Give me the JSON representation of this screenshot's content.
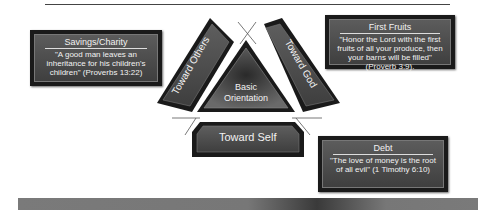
{
  "diagram": {
    "center": {
      "line1": "Basic",
      "line2": "Orientation"
    },
    "segments": {
      "left": "Toward Others",
      "right": "Toward God",
      "bottom": "Toward Self"
    },
    "boxes": {
      "savings": {
        "title": "Savings/Charity",
        "text": "\"A good man leaves an inheritance for his children's children\" (Proverbs 13:22)"
      },
      "first_fruits": {
        "title": "First Fruits",
        "text": "\"Honor the Lord with the first fruits of all your produce, then your barns will be filled\" (Proverb 3:9)."
      },
      "debt": {
        "title": "Debt",
        "text": "\"The love of money is the root of all evil\" (1 Timothy 6:10)"
      }
    },
    "colors": {
      "panel": "#4a4a4a",
      "border": "#1a1a1a",
      "text": "#f2f2f2"
    }
  }
}
